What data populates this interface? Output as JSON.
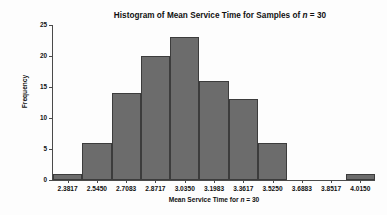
{
  "chart_data": {
    "type": "bar",
    "title": "Histogram of Mean Service Time for Samples of n = 30",
    "title_parts": {
      "before": "Histogram of Mean Service Time for Samples of ",
      "italic": "n",
      "after": " = 30"
    },
    "xlabel": "Mean Service Time for n = 30",
    "xlabel_parts": {
      "before": "Mean Service Time for ",
      "italic": "n",
      "after": " = 30"
    },
    "ylabel": "Frequency",
    "categories": [
      "2.3817",
      "2.5450",
      "2.7083",
      "2.8717",
      "3.0350",
      "3.1983",
      "3.3617",
      "3.5250",
      "3.6883",
      "3.8517",
      "4.0150"
    ],
    "values": [
      1,
      6,
      14,
      20,
      23,
      16,
      13,
      6,
      0,
      0,
      1
    ],
    "xtick_labels": [
      "2.3817",
      "2.5450",
      "2.7083",
      "2.8717",
      "3.0350",
      "3.1983",
      "3.3617",
      "3.5250",
      "3.6883",
      "3.8517",
      "4.0150"
    ],
    "ytick_labels": [
      "0",
      "5",
      "10",
      "15",
      "20",
      "25"
    ],
    "ytick_values": [
      0,
      5,
      10,
      15,
      20,
      25
    ],
    "ylim": [
      0,
      25
    ],
    "grid": false,
    "legend": false,
    "bar_color": "#6c6c6c",
    "bar_edge_color": "#3c3c3c",
    "axis_color": "#4a4a4a",
    "background_color": "#fdfdfd",
    "text_color": "#111111"
  }
}
